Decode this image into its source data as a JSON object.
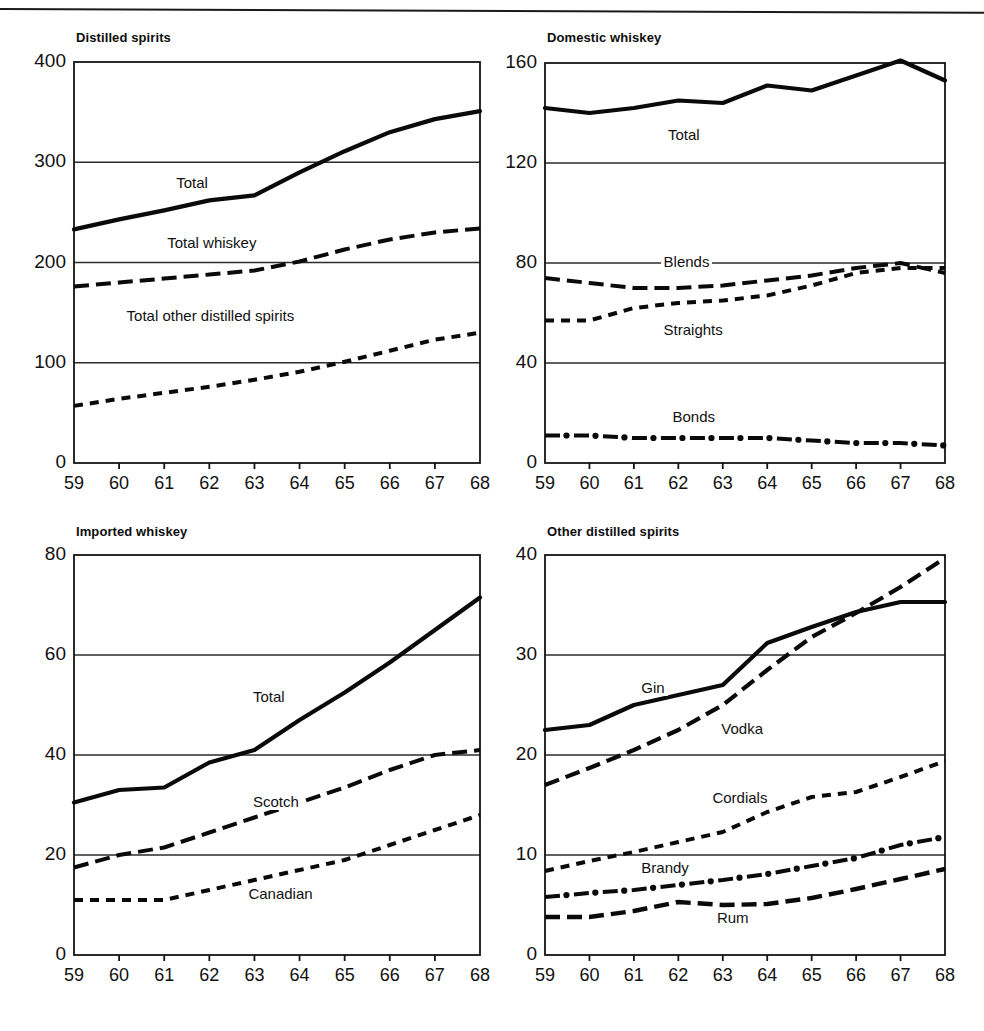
{
  "figure": {
    "background": "#ffffff",
    "ink": "#111111",
    "gridline_color": "#2b2b2b",
    "top_rule": true
  },
  "chart_data": [
    {
      "type": "line",
      "title": "Distilled spirits",
      "xlabel": "",
      "ylabel": "",
      "x": [
        "59",
        "60",
        "61",
        "62",
        "63",
        "64",
        "65",
        "66",
        "67",
        "68"
      ],
      "xlim": [
        59,
        68
      ],
      "ylim": [
        0,
        400
      ],
      "yticks": [
        0,
        100,
        200,
        300,
        400
      ],
      "ytick_labels": [
        "0",
        "100",
        "200",
        "300",
        "400"
      ],
      "grid": true,
      "legend": "inline-annotations",
      "series": [
        {
          "name": "Total",
          "style": "solid",
          "width": 4.2,
          "values": [
            233,
            243,
            252,
            262,
            267,
            290,
            311,
            330,
            343,
            351
          ]
        },
        {
          "name": "Total whiskey",
          "style": "longdash",
          "width": 4.0,
          "values": [
            176,
            180,
            184,
            188,
            192,
            201,
            213,
            223,
            230,
            234
          ]
        },
        {
          "name": "Total other distilled spirits",
          "style": "shortdash",
          "width": 4.0,
          "values": [
            57,
            64,
            70,
            76,
            83,
            91,
            101,
            112,
            123,
            130
          ]
        }
      ],
      "annotations": [
        {
          "text": "Total",
          "x": 61.2,
          "y": 278
        },
        {
          "text": "Total whiskey",
          "x": 61.0,
          "y": 218
        },
        {
          "text": "Total other distilled spirits",
          "x": 60.1,
          "y": 146
        }
      ]
    },
    {
      "type": "line",
      "title": "Domestic whiskey",
      "xlabel": "",
      "ylabel": "",
      "x": [
        "59",
        "60",
        "61",
        "62",
        "63",
        "64",
        "65",
        "66",
        "67",
        "68"
      ],
      "xlim": [
        59,
        68
      ],
      "ylim": [
        0,
        160
      ],
      "yticks": [
        0,
        40,
        80,
        120,
        160
      ],
      "ytick_labels": [
        "0",
        "40",
        "80",
        "120",
        "160"
      ],
      "grid": true,
      "legend": "inline-annotations",
      "series": [
        {
          "name": "Total",
          "style": "solid",
          "width": 4.2,
          "values": [
            142,
            140,
            142,
            145,
            144,
            151,
            149,
            155,
            161,
            153
          ]
        },
        {
          "name": "Blends",
          "style": "longdash",
          "width": 4.0,
          "values": [
            74,
            72,
            70,
            70,
            71,
            73,
            75,
            78,
            80,
            76
          ]
        },
        {
          "name": "Straights",
          "style": "shortdash",
          "width": 4.0,
          "values": [
            57,
            57,
            62,
            64,
            65,
            67,
            71,
            76,
            78,
            78
          ]
        },
        {
          "name": "Bonds",
          "style": "dashdot",
          "width": 4.0,
          "values": [
            11,
            11,
            10,
            10,
            10,
            10,
            9,
            8,
            8,
            7
          ]
        }
      ],
      "annotations": [
        {
          "text": "Total",
          "x": 61.7,
          "y": 131
        },
        {
          "text": "Blends",
          "x": 61.6,
          "y": 80
        },
        {
          "text": "Straights",
          "x": 61.6,
          "y": 53
        },
        {
          "text": "Bonds",
          "x": 61.8,
          "y": 18
        }
      ]
    },
    {
      "type": "line",
      "title": "Imported whiskey",
      "xlabel": "",
      "ylabel": "",
      "x": [
        "59",
        "60",
        "61",
        "62",
        "63",
        "64",
        "65",
        "66",
        "67",
        "68"
      ],
      "xlim": [
        59,
        68
      ],
      "ylim": [
        0,
        80
      ],
      "yticks": [
        0,
        20,
        40,
        60,
        80
      ],
      "ytick_labels": [
        "0",
        "20",
        "40",
        "60",
        "80"
      ],
      "grid": true,
      "legend": "inline-annotations",
      "series": [
        {
          "name": "Total",
          "style": "solid",
          "width": 4.2,
          "values": [
            30.5,
            33.0,
            33.5,
            38.5,
            41.0,
            47.0,
            52.5,
            58.5,
            65.0,
            71.5
          ]
        },
        {
          "name": "Scotch",
          "style": "longdash",
          "width": 4.0,
          "values": [
            17.5,
            20.0,
            21.5,
            24.5,
            27.5,
            30.5,
            33.5,
            37.0,
            40.0,
            41.0
          ]
        },
        {
          "name": "Canadian",
          "style": "shortdash",
          "width": 4.0,
          "values": [
            11.0,
            11.0,
            11.0,
            13.0,
            15.0,
            17.0,
            19.0,
            22.0,
            25.0,
            28.0
          ]
        }
      ],
      "annotations": [
        {
          "text": "Total",
          "x": 62.9,
          "y": 51.5
        },
        {
          "text": "Scotch",
          "x": 62.9,
          "y": 30.5
        },
        {
          "text": "Canadian",
          "x": 62.8,
          "y": 12.0
        }
      ]
    },
    {
      "type": "line",
      "title": "Other distilled spirits",
      "xlabel": "",
      "ylabel": "",
      "x": [
        "59",
        "60",
        "61",
        "62",
        "63",
        "64",
        "65",
        "66",
        "67",
        "68"
      ],
      "xlim": [
        59,
        68
      ],
      "ylim": [
        0,
        40
      ],
      "yticks": [
        0,
        10,
        20,
        30,
        40
      ],
      "ytick_labels": [
        "0",
        "10",
        "20",
        "30",
        "40"
      ],
      "grid": true,
      "legend": "inline-annotations",
      "series": [
        {
          "name": "Gin",
          "style": "solid",
          "width": 4.2,
          "values": [
            22.5,
            23.0,
            25.0,
            26.0,
            27.0,
            31.2,
            32.8,
            34.3,
            35.3,
            35.3
          ]
        },
        {
          "name": "Vodka",
          "style": "longdash",
          "width": 4.2,
          "values": [
            17.0,
            18.7,
            20.5,
            22.5,
            25.0,
            28.5,
            31.8,
            34.2,
            36.8,
            39.7
          ]
        },
        {
          "name": "Cordials",
          "style": "shortdash",
          "width": 4.0,
          "values": [
            8.4,
            9.4,
            10.3,
            11.3,
            12.3,
            14.3,
            15.8,
            16.3,
            17.8,
            19.4
          ]
        },
        {
          "name": "Brandy",
          "style": "dashdot",
          "width": 4.0,
          "values": [
            5.8,
            6.2,
            6.5,
            7.0,
            7.5,
            8.1,
            8.9,
            9.7,
            11.0,
            11.8
          ]
        },
        {
          "name": "Rum",
          "style": "longdash",
          "width": 4.4,
          "values": [
            3.8,
            3.8,
            4.4,
            5.3,
            5.0,
            5.1,
            5.7,
            6.6,
            7.6,
            8.6
          ]
        }
      ],
      "annotations": [
        {
          "text": "Gin",
          "x": 61.1,
          "y": 26.6
        },
        {
          "text": "Vodka",
          "x": 62.9,
          "y": 22.5
        },
        {
          "text": "Cordials",
          "x": 62.7,
          "y": 15.6
        },
        {
          "text": "Brandy",
          "x": 61.1,
          "y": 8.6
        },
        {
          "text": "Rum",
          "x": 62.8,
          "y": 3.6
        }
      ]
    }
  ]
}
